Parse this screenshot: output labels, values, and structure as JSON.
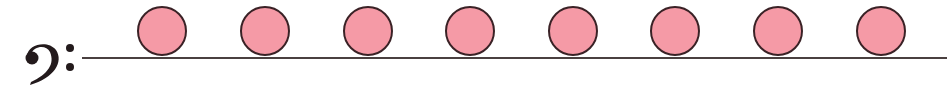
{
  "diagram": {
    "clef": {
      "icon": "bass-clef-icon",
      "glyph": "𝄢"
    },
    "staff_line": {
      "color": "#4a4040"
    },
    "notes": {
      "count": 8,
      "fill_color": "#f59aa6",
      "stroke_color": "#3a2226",
      "centers_x": [
        162,
        265,
        368,
        470,
        573,
        675,
        778,
        881
      ]
    }
  }
}
